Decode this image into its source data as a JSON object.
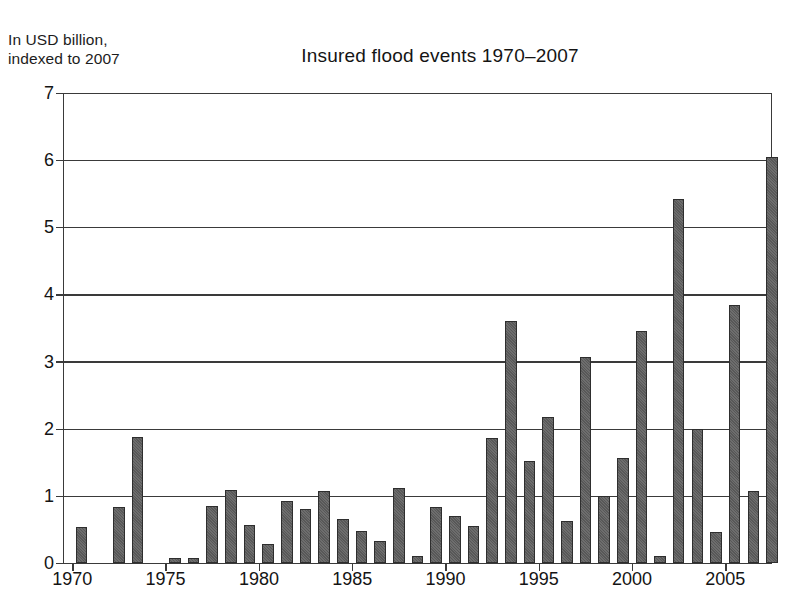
{
  "figure": {
    "axis_caption": "In USD billion,\nindexed to 2007",
    "background_color": "#ffffff",
    "bar_color": "#585858",
    "bar_edge_color": "#2e2e2e",
    "gridline_color": "#3a3a3a"
  },
  "chart_data": {
    "type": "bar",
    "title": "Insured flood events 1970–2007",
    "xlabel": "",
    "ylabel": "In USD billion, indexed to 2007",
    "ylim": [
      0,
      7
    ],
    "xlim": [
      1969.5,
      2007.5
    ],
    "grid": true,
    "legend": null,
    "ytick_labels": [
      "0",
      "1",
      "2",
      "3",
      "4",
      "5",
      "6",
      "7"
    ],
    "yticks": [
      0,
      1,
      2,
      3,
      4,
      5,
      6,
      7
    ],
    "xtick_labels": [
      "1970",
      "1975",
      "1980",
      "1985",
      "1990",
      "1995",
      "2000",
      "2005"
    ],
    "xticks": [
      1970,
      1975,
      1980,
      1985,
      1990,
      1995,
      2000,
      2005
    ],
    "categories": [
      "1970",
      "1971",
      "1972",
      "1973",
      "1974",
      "1975",
      "1976",
      "1977",
      "1978",
      "1979",
      "1980",
      "1981",
      "1982",
      "1983",
      "1984",
      "1985",
      "1986",
      "1987",
      "1988",
      "1989",
      "1990",
      "1991",
      "1992",
      "1993",
      "1994",
      "1995",
      "1996",
      "1997",
      "1998",
      "1999",
      "2000",
      "2001",
      "2002",
      "2003",
      "2004",
      "2005",
      "2006",
      "2007"
    ],
    "values": [
      0.53,
      0.0,
      0.84,
      1.88,
      0.0,
      0.08,
      0.07,
      0.85,
      1.09,
      0.57,
      0.28,
      0.93,
      0.8,
      1.08,
      0.65,
      0.48,
      0.33,
      1.12,
      0.11,
      0.84,
      0.7,
      0.55,
      1.86,
      3.6,
      1.52,
      2.17,
      0.62,
      3.07,
      1.0,
      1.57,
      3.46,
      0.11,
      5.42,
      2.0,
      0.46,
      3.84,
      1.07,
      6.05
    ]
  }
}
